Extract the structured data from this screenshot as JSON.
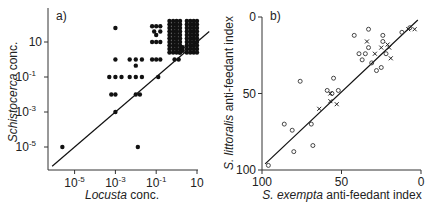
{
  "chart_data": [
    {
      "panel": "a)",
      "type": "scatter",
      "xlabel_italic": "Locusta",
      "xlabel_rest": " conc.",
      "ylabel_italic": "Schistocerca",
      "ylabel_rest": " conc.",
      "xscale": "log",
      "yscale": "log",
      "xticks": [
        {
          "base": "10",
          "exp": "-5",
          "v": -5
        },
        {
          "base": "10",
          "exp": "-3",
          "v": -3
        },
        {
          "base": "10",
          "exp": "-1",
          "v": -1
        },
        {
          "base": "10",
          "exp": "",
          "v": 1
        }
      ],
      "yticks": [
        {
          "base": "10",
          "exp": "",
          "v": 1
        },
        {
          "base": "10",
          "exp": "-1",
          "v": -1
        },
        {
          "base": "10",
          "exp": "-3",
          "v": -3
        },
        {
          "base": "10",
          "exp": "-5",
          "v": -5
        }
      ],
      "xlim_log10": [
        -6.2,
        1.0
      ],
      "ylim_log10": [
        -6.0,
        2.2
      ],
      "line": {
        "x_log10": [
          -6.1,
          1.6
        ],
        "y_log10": [
          -6.1,
          1.6
        ],
        "label": "y = x"
      },
      "points_log10": [
        [
          -5.6,
          -5.0
        ],
        [
          -3.0,
          1.8
        ],
        [
          -3.0,
          0.0
        ],
        [
          -3.3,
          -1.0
        ],
        [
          -3.0,
          -1.0
        ],
        [
          -2.7,
          -1.0
        ],
        [
          -3.2,
          -2.0
        ],
        [
          -3.0,
          -2.0
        ],
        [
          -3.0,
          -3.0
        ],
        [
          -2.3,
          0.0
        ],
        [
          -2.0,
          0.0
        ],
        [
          -1.7,
          0.0
        ],
        [
          -2.0,
          -0.35
        ],
        [
          -2.3,
          -1.0
        ],
        [
          -2.0,
          -1.0
        ],
        [
          -1.7,
          -1.0
        ],
        [
          -2.0,
          -2.0
        ],
        [
          -1.8,
          -2.0
        ],
        [
          -1.9,
          -5.0
        ],
        [
          -1.2,
          1.9
        ],
        [
          -1.0,
          1.9
        ],
        [
          -0.8,
          1.9
        ],
        [
          -1.1,
          1.6
        ],
        [
          -0.8,
          1.6
        ],
        [
          -1.0,
          1.4
        ],
        [
          -1.2,
          1.0
        ],
        [
          -1.0,
          1.0
        ],
        [
          -0.8,
          1.0
        ],
        [
          -1.2,
          0.0
        ],
        [
          -1.0,
          0.0
        ],
        [
          -0.8,
          0.0
        ],
        [
          -0.9,
          -1.0
        ],
        [
          -0.1,
          0.0
        ],
        [
          0.1,
          0.0
        ]
      ],
      "dense_cluster": {
        "x_log10_range": [
          -0.2,
          1.0
        ],
        "y_log10_range": [
          0.3,
          2.3
        ],
        "note": "grid of ~70 points"
      }
    },
    {
      "panel": "b)",
      "type": "scatter",
      "xlabel_italic": "S. exempta",
      "xlabel_rest": " anti-feedant index",
      "ylabel_italic": "S. littoralis",
      "ylabel_rest": " anti-feedant index",
      "xlim": [
        100,
        0
      ],
      "ylim": [
        100,
        0
      ],
      "xticks": [
        "100",
        "50",
        "0"
      ],
      "yticks": [
        "0",
        "50",
        "100"
      ],
      "line": {
        "x": [
          98,
          2
        ],
        "y": [
          96,
          2
        ]
      },
      "series": [
        {
          "name": "circles",
          "marker": "o",
          "points": [
            [
              96,
              97
            ],
            [
              86,
              70
            ],
            [
              81,
              74
            ],
            [
              80,
              88
            ],
            [
              76,
              42
            ],
            [
              69,
              70
            ],
            [
              68,
              84
            ],
            [
              59,
              48
            ],
            [
              55,
              40
            ],
            [
              52,
              48
            ],
            [
              56,
              50
            ],
            [
              42,
              12
            ],
            [
              39,
              24
            ],
            [
              37,
              28
            ],
            [
              33,
              8
            ],
            [
              33,
              20
            ],
            [
              35,
              24
            ],
            [
              31,
              30
            ],
            [
              28,
              35
            ],
            [
              25,
              33
            ],
            [
              24,
              12
            ],
            [
              24,
              16
            ],
            [
              22,
              24
            ],
            [
              12,
              10
            ],
            [
              7,
              7
            ]
          ]
        },
        {
          "name": "crosses",
          "marker": "x",
          "points": [
            [
              64,
              60
            ],
            [
              57,
              50
            ],
            [
              57,
              55
            ],
            [
              53,
              57
            ],
            [
              34,
              16
            ],
            [
              29,
              24
            ],
            [
              25,
              20
            ],
            [
              21,
              18
            ],
            [
              20,
              20
            ],
            [
              19,
              27
            ],
            [
              8,
              8
            ],
            [
              4,
              8
            ]
          ]
        }
      ]
    }
  ]
}
